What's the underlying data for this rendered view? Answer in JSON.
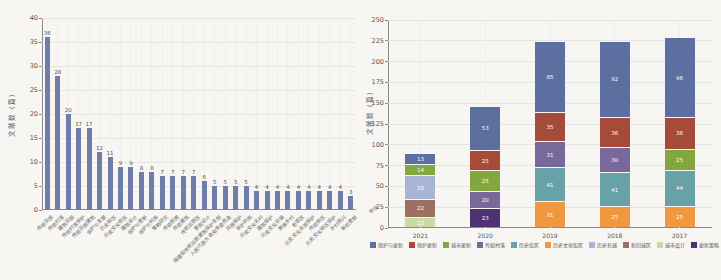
{
  "chart_data": [
    {
      "type": "bar",
      "title": "",
      "ylabel": "文献数（篇）",
      "ylim": [
        0,
        40
      ],
      "ytick_step": 5,
      "grid": "both",
      "bar_color": "#6e7da9",
      "categories": [
        "传统风貌",
        "传统村落",
        "建筑风貌",
        "传统村落保护",
        "传统风貌建筑",
        "保护与发展",
        "历史街区",
        "历史文化街区",
        "建筑设计",
        "保护与更新",
        "保护与利用",
        "策略研究",
        "传统民居",
        "传统建筑",
        "传统风貌区",
        "景观设计",
        "福建省传统风貌建筑保护条例",
        "人民代表大会常务委员会",
        "风貌保护",
        "保护利用",
        "历史文化名村",
        "建筑保护",
        "历史文化名镇",
        "美丽乡村",
        "老城区",
        "历史文化名城保护",
        "传统街区",
        "历史文化街区保护",
        "乡村振兴",
        "有机更新"
      ],
      "values": [
        36,
        28,
        20,
        17,
        17,
        12,
        11,
        9,
        9,
        8,
        8,
        7,
        7,
        7,
        7,
        6,
        5,
        5,
        5,
        5,
        4,
        4,
        4,
        4,
        4,
        4,
        4,
        4,
        4,
        3
      ]
    },
    {
      "type": "stacked-bar",
      "title": "",
      "ylabel": "文献数（篇）",
      "xlabel": "年份",
      "ylim": [
        0,
        250
      ],
      "ytick_step": 25,
      "grid": "both",
      "legend_position": "bottom",
      "categories": [
        "2021",
        "2020",
        "2019",
        "2018",
        "2017"
      ],
      "legend": [
        {
          "label": "保护与更新",
          "color": "#5b70a1"
        },
        {
          "label": "保护更新",
          "color": "#a64b3a"
        },
        {
          "label": "城市更新",
          "color": "#81a73e"
        },
        {
          "label": "传统村落",
          "color": "#79689a"
        },
        {
          "label": "历史街区",
          "color": "#68a1a8"
        },
        {
          "label": "历史文化街区",
          "color": "#f0983f"
        },
        {
          "label": "历史名城",
          "color": "#a9b5d5"
        },
        {
          "label": "新旧城区",
          "color": "#9c7063"
        },
        {
          "label": "城市设计",
          "color": "#c8dba2"
        },
        {
          "label": "更新策略",
          "color": "#4e3374"
        }
      ],
      "stacks": [
        {
          "year": "2021",
          "segments": [
            {
              "legend": 8,
              "value": 12
            },
            {
              "legend": 7,
              "value": 22
            },
            {
              "legend": 6,
              "value": 28
            },
            {
              "legend": 2,
              "value": 14
            },
            {
              "legend": 0,
              "value": 13
            }
          ]
        },
        {
          "year": "2020",
          "segments": [
            {
              "legend": 9,
              "value": 23
            },
            {
              "legend": 3,
              "value": 20
            },
            {
              "legend": 2,
              "value": 25
            },
            {
              "legend": 1,
              "value": 25
            },
            {
              "legend": 0,
              "value": 53
            }
          ]
        },
        {
          "year": "2019",
          "segments": [
            {
              "legend": 5,
              "value": 31
            },
            {
              "legend": 4,
              "value": 41
            },
            {
              "legend": 3,
              "value": 31
            },
            {
              "legend": 1,
              "value": 35
            },
            {
              "legend": 0,
              "value": 85
            }
          ]
        },
        {
          "year": "2018",
          "segments": [
            {
              "legend": 5,
              "value": 25
            },
            {
              "legend": 4,
              "value": 41
            },
            {
              "legend": 3,
              "value": 30
            },
            {
              "legend": 1,
              "value": 36
            },
            {
              "legend": 0,
              "value": 92
            }
          ]
        },
        {
          "year": "2017",
          "segments": [
            {
              "legend": 5,
              "value": 25
            },
            {
              "legend": 4,
              "value": 44
            },
            {
              "legend": 2,
              "value": 25
            },
            {
              "legend": 1,
              "value": 38
            },
            {
              "legend": 0,
              "value": 96
            }
          ]
        }
      ]
    }
  ]
}
